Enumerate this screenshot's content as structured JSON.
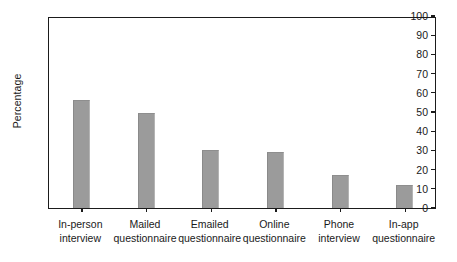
{
  "chart_data": {
    "type": "bar",
    "title": "",
    "xlabel": "",
    "ylabel": "Percentage",
    "ylim": [
      0,
      100
    ],
    "ytick_step": 10,
    "yticks": [
      0,
      10,
      20,
      30,
      40,
      50,
      60,
      70,
      80,
      90,
      100
    ],
    "ytick_labels": [
      "0",
      "10",
      "20",
      "30",
      "40",
      "50",
      "60",
      "70",
      "80",
      "90",
      "100"
    ],
    "grid": false,
    "legend": null,
    "bar_color": "#9b9b9b",
    "axis_color": "#1b1b1b",
    "categories": [
      "In-person interview",
      "Mailed questionnaire",
      "Emailed questionnaire",
      "Online questionnaire",
      "Phone interview",
      "In-app questionnaire"
    ],
    "category_lines": [
      [
        "In-person",
        "interview"
      ],
      [
        "Mailed",
        "questionnaire"
      ],
      [
        "Emailed",
        "questionnaire"
      ],
      [
        "Online",
        "questionnaire"
      ],
      [
        "Phone",
        "interview"
      ],
      [
        "In-app",
        "questionnaire"
      ]
    ],
    "values": [
      56.5,
      49.5,
      30,
      29,
      17,
      12
    ]
  }
}
